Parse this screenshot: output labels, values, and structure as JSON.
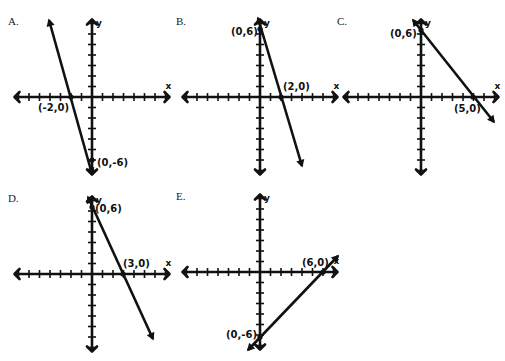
{
  "graphs": [
    {
      "id": "A",
      "label": "A.",
      "origin": [
        92,
        97
      ],
      "line": [
        [
          49,
          20
        ],
        [
          92,
          174
        ]
      ],
      "intercepts": [
        {
          "text": "(-2,0)",
          "x": 38,
          "y": 111
        },
        {
          "text": "(0,-6)",
          "x": 97,
          "y": 166
        }
      ],
      "points": [
        [
          71,
          97
        ],
        [
          92,
          160
        ]
      ]
    },
    {
      "id": "B",
      "label": "B.",
      "origin": [
        260,
        97
      ],
      "line": [
        [
          258,
          18
        ],
        [
          302,
          166
        ]
      ],
      "intercepts": [
        {
          "text": "(0,6)",
          "x": 231,
          "y": 35
        },
        {
          "text": "(2,0)",
          "x": 283,
          "y": 90
        }
      ],
      "points": [
        [
          260,
          29
        ],
        [
          281,
          97
        ]
      ]
    },
    {
      "id": "C",
      "label": "C.",
      "origin": [
        421,
        97
      ],
      "line": [
        [
          413,
          20
        ],
        [
          494,
          122
        ]
      ],
      "intercepts": [
        {
          "text": "(0,6)",
          "x": 390,
          "y": 37
        },
        {
          "text": "(5,0)",
          "x": 454,
          "y": 112
        }
      ],
      "points": [
        [
          421,
          30
        ],
        [
          473,
          97
        ]
      ]
    },
    {
      "id": "D",
      "label": "D.",
      "origin": [
        92,
        274
      ],
      "line": [
        [
          88,
          197
        ],
        [
          153,
          339
        ]
      ],
      "intercepts": [
        {
          "text": "(0,6)",
          "x": 95,
          "y": 212
        },
        {
          "text": "(3,0)",
          "x": 123,
          "y": 267
        }
      ],
      "points": [
        [
          92,
          207
        ],
        [
          123,
          274
        ]
      ]
    },
    {
      "id": "E",
      "label": "E.",
      "origin": [
        260,
        272
      ],
      "line": [
        [
          248,
          350
        ],
        [
          338,
          256
        ]
      ],
      "intercepts": [
        {
          "text": "(6,0)",
          "x": 302,
          "y": 266
        },
        {
          "text": "(0,-6)",
          "x": 226,
          "y": 338
        }
      ],
      "points": [
        [
          323,
          272
        ],
        [
          260,
          337
        ]
      ]
    }
  ],
  "axis_labels": {
    "x": "x",
    "y": "y"
  },
  "colors": {
    "ink": "#111111",
    "background": "#ffffff"
  }
}
